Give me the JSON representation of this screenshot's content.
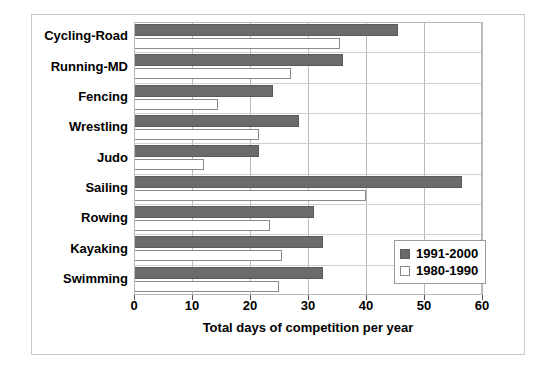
{
  "chart_data": {
    "type": "bar",
    "orientation": "horizontal",
    "title": "",
    "xlabel": "Total days of competition per year",
    "ylabel": "",
    "xlim": [
      0,
      60
    ],
    "xticks": [
      0,
      10,
      20,
      30,
      40,
      50,
      60
    ],
    "xtick_labels": [
      "0",
      "10",
      "20",
      "30",
      "40",
      "50",
      "60"
    ],
    "grid": "vertical",
    "legend_position": "inside-right-lower",
    "categories": [
      "Cycling-Road",
      "Running-MD",
      "Fencing",
      "Wrestling",
      "Judo",
      "Sailing",
      "Rowing",
      "Kayaking",
      "Swimming"
    ],
    "series": [
      {
        "name": "1991-2000",
        "color": "#6b6b6b",
        "values": [
          45.5,
          36,
          24,
          28.5,
          21.5,
          56.5,
          31,
          32.5,
          32.5
        ]
      },
      {
        "name": "1980-1990",
        "color": "#ffffff",
        "values": [
          35.5,
          27,
          14.5,
          21.5,
          12,
          40,
          23.5,
          25.5,
          25
        ]
      }
    ]
  },
  "legend": {
    "items": [
      {
        "label": "1991-2000",
        "swatch": "dark"
      },
      {
        "label": "1980-1990",
        "swatch": "light"
      }
    ]
  },
  "axis": {
    "xlabel": "Total days of competition per year"
  }
}
